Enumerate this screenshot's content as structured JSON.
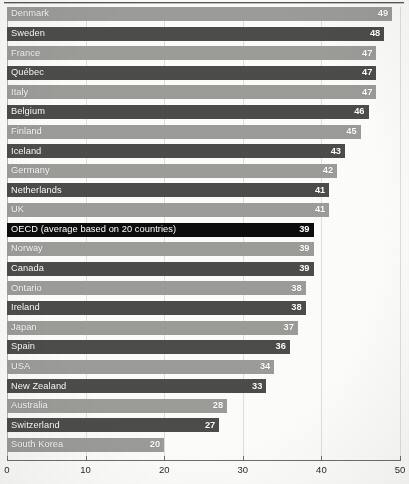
{
  "chart_data": {
    "type": "bar",
    "orientation": "horizontal",
    "title": "",
    "subtitle": "",
    "xlabel": "",
    "ylabel": "",
    "xlim": [
      0,
      50
    ],
    "xticks": [
      0,
      10,
      20,
      30,
      40,
      50
    ],
    "xtick_labels": [
      "0",
      "10",
      "20",
      "30",
      "40",
      "50"
    ],
    "grid": true,
    "legend": null,
    "categories": [
      "Denmark",
      "Sweden",
      "France",
      "Québec",
      "Italy",
      "Belgium",
      "Finland",
      "Iceland",
      "Germany",
      "Netherlands",
      "UK",
      "OECD (average based on 20 countries)",
      "Norway",
      "Canada",
      "Ontario",
      "Ireland",
      "Japan",
      "Spain",
      "USA",
      "New Zealand",
      "Australia",
      "Switzerland",
      "South Korea"
    ],
    "values": [
      49,
      48,
      47,
      47,
      47,
      46,
      45,
      43,
      42,
      41,
      41,
      39,
      39,
      39,
      38,
      38,
      37,
      36,
      34,
      33,
      28,
      27,
      20
    ],
    "bars": [
      {
        "label": "Denmark",
        "value": 49,
        "value_label": "49",
        "style": "light"
      },
      {
        "label": "Sweden",
        "value": 48,
        "value_label": "48",
        "style": "dark"
      },
      {
        "label": "France",
        "value": 47,
        "value_label": "47",
        "style": "light"
      },
      {
        "label": "Québec",
        "value": 47,
        "value_label": "47",
        "style": "dark"
      },
      {
        "label": "Italy",
        "value": 47,
        "value_label": "47",
        "style": "light"
      },
      {
        "label": "Belgium",
        "value": 46,
        "value_label": "46",
        "style": "dark"
      },
      {
        "label": "Finland",
        "value": 45,
        "value_label": "45",
        "style": "light"
      },
      {
        "label": "Iceland",
        "value": 43,
        "value_label": "43",
        "style": "dark"
      },
      {
        "label": "Germany",
        "value": 42,
        "value_label": "42",
        "style": "light"
      },
      {
        "label": "Netherlands",
        "value": 41,
        "value_label": "41",
        "style": "dark"
      },
      {
        "label": "UK",
        "value": 41,
        "value_label": "41",
        "style": "light"
      },
      {
        "label": "OECD (average based on 20 countries)",
        "value": 39,
        "value_label": "39",
        "style": "black"
      },
      {
        "label": "Norway",
        "value": 39,
        "value_label": "39",
        "style": "light"
      },
      {
        "label": "Canada",
        "value": 39,
        "value_label": "39",
        "style": "dark"
      },
      {
        "label": "Ontario",
        "value": 38,
        "value_label": "38",
        "style": "light"
      },
      {
        "label": "Ireland",
        "value": 38,
        "value_label": "38",
        "style": "dark"
      },
      {
        "label": "Japan",
        "value": 37,
        "value_label": "37",
        "style": "light"
      },
      {
        "label": "Spain",
        "value": 36,
        "value_label": "36",
        "style": "dark"
      },
      {
        "label": "USA",
        "value": 34,
        "value_label": "34",
        "style": "light"
      },
      {
        "label": "New Zealand",
        "value": 33,
        "value_label": "33",
        "style": "dark"
      },
      {
        "label": "Australia",
        "value": 28,
        "value_label": "28",
        "style": "light"
      },
      {
        "label": "Switzerland",
        "value": 27,
        "value_label": "27",
        "style": "dark"
      },
      {
        "label": "South Korea",
        "value": 20,
        "value_label": "20",
        "style": "light"
      }
    ],
    "colors": {
      "light_bar": "#9c9c99",
      "dark_bar": "#4c4c4a",
      "highlight_bar": "#0d0d0d",
      "bar_text": "#ffffff",
      "axis": "#6e6e6a",
      "grid": "#c9c9c4",
      "background": "#fdfdfb"
    }
  }
}
